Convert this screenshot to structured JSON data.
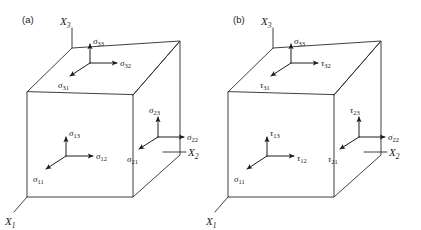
{
  "figure": {
    "width": 421,
    "height": 230,
    "background_color": "#ffffff",
    "line_color": "#2b2b2b",
    "text_color": "#1a1a1a"
  },
  "panels": [
    {
      "id": "panel-a",
      "label": "(a)",
      "notation": "sigma-only",
      "axes": [
        {
          "name": "x3-axis",
          "symbol": "X",
          "subscript": "3",
          "direction": "up"
        },
        {
          "name": "x2-axis",
          "symbol": "X",
          "subscript": "2",
          "direction": "right"
        },
        {
          "name": "x1-axis",
          "symbol": "X",
          "subscript": "1",
          "direction": "down-left"
        }
      ],
      "faces": [
        {
          "name": "top-face",
          "normal_axis": "X3",
          "components": [
            {
              "name": "sigma-33",
              "symbol": "σ",
              "subscript": "33",
              "direction": "up",
              "type": "normal"
            },
            {
              "name": "sigma-32",
              "symbol": "σ",
              "subscript": "32",
              "direction": "right",
              "type": "shear"
            },
            {
              "name": "sigma-31",
              "symbol": "σ",
              "subscript": "31",
              "direction": "down-left",
              "type": "shear"
            }
          ]
        },
        {
          "name": "front-face",
          "normal_axis": "X1",
          "components": [
            {
              "name": "sigma-13",
              "symbol": "σ",
              "subscript": "13",
              "direction": "up",
              "type": "shear"
            },
            {
              "name": "sigma-12",
              "symbol": "σ",
              "subscript": "12",
              "direction": "right",
              "type": "shear"
            },
            {
              "name": "sigma-11",
              "symbol": "σ",
              "subscript": "11",
              "direction": "down-left",
              "type": "normal"
            }
          ]
        },
        {
          "name": "right-face",
          "normal_axis": "X2",
          "components": [
            {
              "name": "sigma-23",
              "symbol": "σ",
              "subscript": "23",
              "direction": "up",
              "type": "shear"
            },
            {
              "name": "sigma-22",
              "symbol": "σ",
              "subscript": "22",
              "direction": "right",
              "type": "normal"
            },
            {
              "name": "sigma-21",
              "symbol": "σ",
              "subscript": "21",
              "direction": "down-left",
              "type": "shear"
            }
          ]
        }
      ]
    },
    {
      "id": "panel-b",
      "label": "(b)",
      "notation": "sigma-tau",
      "axes": [
        {
          "name": "x3-axis",
          "symbol": "X",
          "subscript": "3",
          "direction": "up"
        },
        {
          "name": "x2-axis",
          "symbol": "X",
          "subscript": "2",
          "direction": "right"
        },
        {
          "name": "x1-axis",
          "symbol": "X",
          "subscript": "1",
          "direction": "down-left"
        }
      ],
      "faces": [
        {
          "name": "top-face",
          "normal_axis": "X3",
          "components": [
            {
              "name": "sigma-33",
              "symbol": "σ",
              "subscript": "33",
              "direction": "up",
              "type": "normal"
            },
            {
              "name": "tau-32",
              "symbol": "τ",
              "subscript": "32",
              "direction": "right",
              "type": "shear"
            },
            {
              "name": "tau-31",
              "symbol": "τ",
              "subscript": "31",
              "direction": "down-left",
              "type": "shear"
            }
          ]
        },
        {
          "name": "front-face",
          "normal_axis": "X1",
          "components": [
            {
              "name": "tau-13",
              "symbol": "τ",
              "subscript": "13",
              "direction": "up",
              "type": "shear"
            },
            {
              "name": "tau-12",
              "symbol": "τ",
              "subscript": "12",
              "direction": "right",
              "type": "shear"
            },
            {
              "name": "sigma-11",
              "symbol": "σ",
              "subscript": "11",
              "direction": "down-left",
              "type": "normal"
            }
          ]
        },
        {
          "name": "right-face",
          "normal_axis": "X2",
          "components": [
            {
              "name": "tau-23",
              "symbol": "τ",
              "subscript": "23",
              "direction": "up",
              "type": "shear"
            },
            {
              "name": "sigma-22",
              "symbol": "σ",
              "subscript": "22",
              "direction": "right",
              "type": "normal"
            },
            {
              "name": "tau-21",
              "symbol": "τ",
              "subscript": "21",
              "direction": "down-left",
              "type": "shear"
            }
          ]
        }
      ]
    }
  ]
}
